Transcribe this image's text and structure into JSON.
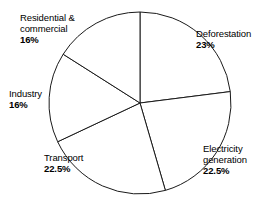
{
  "chart_data": {
    "type": "pie",
    "title": "",
    "subtitle": "",
    "xlabel": "",
    "ylabel": "",
    "legend_position": "none",
    "grid": false,
    "units": "percent",
    "total": 100,
    "start_angle_deg": 0,
    "direction": "clockwise",
    "categories": [
      "Deforestation",
      "Electricity generation",
      "Transport",
      "Industry",
      "Residential & commercial"
    ],
    "values": [
      23,
      22.5,
      22.5,
      16,
      16
    ],
    "value_labels": [
      "23%",
      "22.5%",
      "22.5%",
      "16%",
      "16%"
    ],
    "slices": [
      {
        "label": "Deforestation",
        "label_line1": "Deforestation",
        "label_line2": "",
        "value": 23,
        "value_label": "23%",
        "color": "#ffffff",
        "stroke": "#1a1a1a"
      },
      {
        "label": "Electricity generation",
        "label_line1": "Electricity",
        "label_line2": "generation",
        "value": 22.5,
        "value_label": "22.5%",
        "color": "#ffffff",
        "stroke": "#1a1a1a"
      },
      {
        "label": "Transport",
        "label_line1": "Transport",
        "label_line2": "",
        "value": 22.5,
        "value_label": "22.5%",
        "color": "#ffffff",
        "stroke": "#1a1a1a"
      },
      {
        "label": "Industry",
        "label_line1": "Industry",
        "label_line2": "",
        "value": 16,
        "value_label": "16%",
        "color": "#ffffff",
        "stroke": "#1a1a1a"
      },
      {
        "label": "Residential & commercial",
        "label_line1": "Residential &",
        "label_line2": "commercial",
        "value": 16,
        "value_label": "16%",
        "color": "#ffffff",
        "stroke": "#1a1a1a"
      }
    ]
  },
  "geometry": {
    "center_x": 140,
    "center_y": 103,
    "radius": 91
  }
}
